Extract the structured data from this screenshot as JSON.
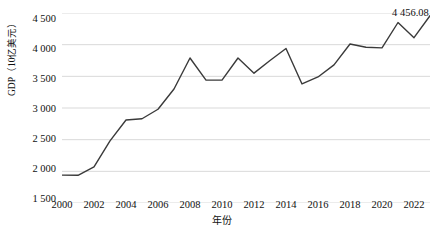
{
  "chart_data": {
    "type": "line",
    "title": "",
    "xlabel": "年份",
    "ylabel": "GDP（10亿美元）",
    "x": [
      2000,
      2001,
      2002,
      2003,
      2004,
      2005,
      2006,
      2007,
      2008,
      2009,
      2010,
      2011,
      2012,
      2013,
      2014,
      2015,
      2016,
      2017,
      2018,
      2019,
      2020,
      2021,
      2022,
      2023
    ],
    "values": [
      1940,
      1938,
      2070,
      2480,
      2810,
      2830,
      2980,
      3300,
      3790,
      3440,
      3440,
      3790,
      3550,
      3750,
      3940,
      3380,
      3490,
      3680,
      4010,
      3960,
      3950,
      4350,
      4110,
      4456.08
    ],
    "series": [
      {
        "name": "GDP",
        "values": [
          1940,
          1938,
          2070,
          2480,
          2810,
          2830,
          2980,
          3300,
          3790,
          3440,
          3440,
          3790,
          3550,
          3750,
          3940,
          3380,
          3490,
          3680,
          4010,
          3960,
          3950,
          4350,
          4110,
          4456.08
        ]
      }
    ],
    "ylim": [
      1500,
      4500
    ],
    "xlim": [
      2000,
      2023
    ],
    "yticks": [
      1500,
      2000,
      2500,
      3000,
      3500,
      4000,
      4500
    ],
    "ytick_labels": [
      "1 500",
      "2 000",
      "2 500",
      "3 000",
      "3 500",
      "4 000",
      "4 500"
    ],
    "xticks": [
      2000,
      2002,
      2004,
      2006,
      2008,
      2010,
      2012,
      2014,
      2016,
      2018,
      2020,
      2022
    ],
    "xtick_labels": [
      "2000",
      "2002",
      "2004",
      "2006",
      "2008",
      "2010",
      "2012",
      "2014",
      "2016",
      "2018",
      "2020",
      "2022"
    ],
    "grid": "horizontal",
    "legend": "none",
    "annotations": [
      {
        "name": "end-value-label",
        "text": "4 456.08",
        "x": 2023,
        "y": 4456.08
      }
    ],
    "line_color": "#3a3a3a",
    "grid_color": "#d9d9d9"
  }
}
